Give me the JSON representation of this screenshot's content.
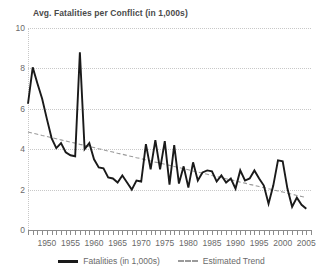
{
  "chart_data": {
    "type": "line",
    "title": "Avg. Fatalities per Conflict (in 1,000s)",
    "xlabel": "",
    "ylabel": "",
    "xlim": [
      1946,
      2006
    ],
    "ylim": [
      0,
      10
    ],
    "yticks": [
      0,
      2,
      4,
      6,
      8,
      10
    ],
    "ytick_labels": [
      "0",
      "2",
      "4",
      "6",
      "8",
      "10"
    ],
    "xticks": [
      1950,
      1955,
      1960,
      1965,
      1970,
      1975,
      1980,
      1985,
      1990,
      1995,
      2000,
      2005
    ],
    "xtick_labels": [
      "1950",
      "1955",
      "1960",
      "1965",
      "1970",
      "1975",
      "1980",
      "1985",
      "1990",
      "1995",
      "2000",
      "2005"
    ],
    "x_minor_tick_step": 1,
    "grid": "horizontal-dotted",
    "legend_position": "bottom-center",
    "colors": {
      "series_fatalities": "#1a1a1a",
      "series_trend": "#9a9a9a",
      "grid": "#c8c8c8",
      "text": "#6a6a6a",
      "title": "#4a4a4a",
      "background": "#ffffff"
    },
    "x": [
      1946,
      1947,
      1948,
      1949,
      1950,
      1951,
      1952,
      1953,
      1954,
      1955,
      1956,
      1957,
      1958,
      1959,
      1960,
      1961,
      1962,
      1963,
      1964,
      1965,
      1966,
      1967,
      1968,
      1969,
      1970,
      1971,
      1972,
      1973,
      1974,
      1975,
      1976,
      1977,
      1978,
      1979,
      1980,
      1981,
      1982,
      1983,
      1984,
      1985,
      1986,
      1987,
      1988,
      1989,
      1990,
      1991,
      1992,
      1993,
      1994,
      1995,
      1996,
      1997,
      1998,
      1999,
      2000,
      2001,
      2002,
      2003,
      2004,
      2005
    ],
    "series": [
      {
        "name": "Fatalities (in 1,000s)",
        "style": "solid",
        "color": "#1a1a1a",
        "values": [
          6.25,
          8.05,
          7.25,
          6.5,
          5.5,
          4.55,
          4.05,
          4.3,
          3.85,
          3.7,
          3.65,
          8.8,
          4.0,
          4.3,
          3.5,
          3.1,
          3.05,
          2.6,
          2.55,
          2.35,
          2.7,
          2.35,
          2.0,
          2.45,
          2.4,
          4.25,
          3.0,
          4.45,
          3.0,
          4.4,
          2.25,
          4.2,
          2.3,
          3.15,
          2.1,
          3.35,
          2.45,
          2.85,
          2.95,
          2.9,
          2.4,
          2.7,
          2.35,
          2.55,
          2.05,
          2.95,
          2.45,
          2.55,
          2.95,
          2.55,
          2.2,
          1.3,
          2.2,
          3.45,
          3.4,
          2.05,
          1.15,
          1.6,
          1.25,
          1.05
        ]
      },
      {
        "name": "Estimated Trend",
        "style": "dashed",
        "color": "#9a9a9a",
        "values": [
          4.85,
          4.79,
          4.74,
          4.68,
          4.63,
          4.57,
          4.52,
          4.46,
          4.41,
          4.35,
          4.3,
          4.24,
          4.19,
          4.13,
          4.08,
          4.02,
          3.97,
          3.91,
          3.86,
          3.8,
          3.75,
          3.69,
          3.64,
          3.58,
          3.53,
          3.47,
          3.42,
          3.36,
          3.31,
          3.25,
          3.2,
          3.14,
          3.09,
          3.03,
          2.98,
          2.92,
          2.87,
          2.81,
          2.76,
          2.7,
          2.65,
          2.59,
          2.54,
          2.48,
          2.43,
          2.37,
          2.32,
          2.26,
          2.21,
          2.15,
          2.1,
          2.04,
          1.99,
          1.93,
          1.88,
          1.82,
          1.77,
          1.71,
          1.66,
          1.6
        ]
      }
    ]
  },
  "legend": [
    {
      "label": "Fatalities (in 1,000s)",
      "style": "solid"
    },
    {
      "label": "Estimated Trend",
      "style": "dashed"
    }
  ]
}
